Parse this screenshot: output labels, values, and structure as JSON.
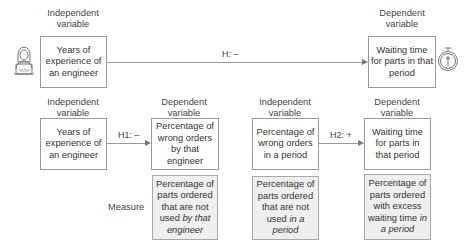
{
  "top_model": {
    "independent_label": [
      "Independent",
      "variable"
    ],
    "dependent_label": [
      "Dependent",
      "variable"
    ],
    "independent_box": "Years of experience of an engineer",
    "dependent_box": "Waiting time for parts in that period",
    "hypothesis": "H: –",
    "left_icon": "engineer-laptop-icon",
    "right_icon": "stopwatch-icon"
  },
  "model_h1": {
    "independent_label": [
      "Independent",
      "variable"
    ],
    "dependent_label": [
      "Dependent",
      "variable"
    ],
    "independent_box": "Years of experience of an engineer",
    "dependent_box": "Percentage of wrong orders by that engineer",
    "hypothesis": "H1: –",
    "measure": {
      "plain": "Percentage of parts ordered that are not used ",
      "italic": "by that engineer"
    }
  },
  "model_h2": {
    "independent_label": [
      "Independent",
      "variable"
    ],
    "dependent_label": [
      "Dependent",
      "variable"
    ],
    "independent_box": "Percentage of wrong orders in a period",
    "dependent_box": "Waiting time for parts in that period",
    "hypothesis": "H2: +",
    "independent_measure": {
      "plain": "Percentage of parts ordered that are not used ",
      "italic": "in a period"
    },
    "dependent_measure": {
      "plain": "Percentage of parts ordered with excess waiting time ",
      "italic": "in a period"
    }
  },
  "measure_label": "Measure"
}
